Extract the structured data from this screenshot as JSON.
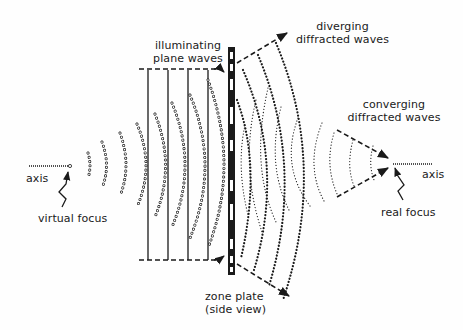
{
  "diagram": {
    "type": "zone-plate-diffraction",
    "labels": {
      "illuminating": [
        "illuminating",
        "plane waves"
      ],
      "diverging": [
        "diverging",
        "diffracted waves"
      ],
      "converging": [
        "converging",
        "diffracted waves"
      ],
      "axis_left": "axis",
      "axis_right": "axis",
      "virtual_focus": "virtual focus",
      "real_focus": "real focus",
      "zone_plate": [
        "zone plate",
        "(side view)"
      ]
    },
    "colors": {
      "ink": "#1a1a1a",
      "background": "#fefefe"
    },
    "components": [
      {
        "id": "plane-waves",
        "kind": "solid vertical lines",
        "count": 4
      },
      {
        "id": "virtual-wavefronts",
        "kind": "open-circle arcs",
        "count": 6
      },
      {
        "id": "zone-plate",
        "kind": "alternating black/white strip"
      },
      {
        "id": "diverging-wavefronts",
        "kind": "heavy dotted arcs",
        "count": 4
      },
      {
        "id": "converging-wavefronts",
        "kind": "light dotted arcs",
        "count": 3
      }
    ]
  }
}
